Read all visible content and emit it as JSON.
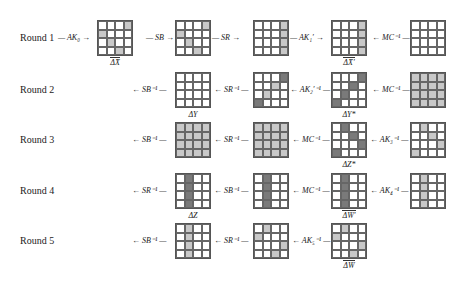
{
  "rounds": [
    {
      "label": "Round 1",
      "y": 20,
      "ops": [
        {
          "text": "— AK₀ →",
          "x": 58
        },
        {
          "text": "— SB →",
          "x": 146
        },
        {
          "text": "— SR →",
          "x": 212
        },
        {
          "text": "— AK₁′ →",
          "x": 290
        },
        {
          "text": "← MC⁻¹ —",
          "x": 372
        }
      ],
      "grids": [
        {
          "x": 97,
          "cells": "...l|l...|.l..|..l.",
          "caption": "ΔX̄",
          "overline": true
        },
        {
          "x": 175,
          "cells": "...l|l...|.l..|..l.",
          "caption": ""
        },
        {
          "x": 253,
          "cells": "...l|...l|...l|...l",
          "caption": ""
        },
        {
          "x": 331,
          "cells": "...l|...l|...l|...l",
          "caption": "ΔX̄′",
          "overline": true
        },
        {
          "x": 410,
          "cells": "....|....|....|....",
          "caption": ""
        }
      ]
    },
    {
      "label": "Round 2",
      "y": 72,
      "ops": [
        {
          "text": "← SB⁻¹ —",
          "x": 132
        },
        {
          "text": "← SR⁻¹ —",
          "x": 214
        },
        {
          "text": "← AK₂′⁻¹ —",
          "x": 290
        },
        {
          "text": "← MC⁻¹ —",
          "x": 372
        }
      ],
      "grids": [
        {
          "x": 175,
          "cells": "....|....|....|....",
          "caption": "ΔY"
        },
        {
          "x": 253,
          "cells": "...d|..l.|.l..|d...",
          "caption": ""
        },
        {
          "x": 331,
          "cells": "...d|..d.|.d..|d...",
          "caption": "ΔY*"
        },
        {
          "x": 410,
          "cells": "llll|llll|llll|llll",
          "caption": ""
        }
      ]
    },
    {
      "label": "Round 3",
      "y": 122,
      "ops": [
        {
          "text": "← SB⁻¹ —",
          "x": 132
        },
        {
          "text": "← SR⁻¹ —",
          "x": 214
        },
        {
          "text": "← MC⁻¹ —",
          "x": 292
        },
        {
          "text": "← AK₃⁻¹ —",
          "x": 370
        }
      ],
      "grids": [
        {
          "x": 175,
          "cells": "llll|llll|llll|llll",
          "caption": ""
        },
        {
          "x": 253,
          "cells": "llll|llll|llll|llll",
          "caption": ""
        },
        {
          "x": 331,
          "cells": ".d..|..d.|...d|d...",
          "caption": "ΔZ*"
        },
        {
          "x": 410,
          "cells": ".l..|..l.|...l|l...",
          "caption": ""
        }
      ]
    },
    {
      "label": "Round 4",
      "y": 173,
      "ops": [
        {
          "text": "← SR⁻¹ —",
          "x": 132
        },
        {
          "text": "← SB⁻¹ —",
          "x": 214
        },
        {
          "text": "← MC⁻¹ —",
          "x": 292
        },
        {
          "text": "← AK₄⁻¹ —",
          "x": 370
        }
      ],
      "grids": [
        {
          "x": 175,
          "cells": ".d..|.d..|.d..|.d..",
          "caption": "ΔZ"
        },
        {
          "x": 253,
          "cells": ".d..|.d..|.d..|.d..",
          "caption": ""
        },
        {
          "x": 331,
          "cells": ".d..|.d..|.d..|.d..",
          "caption": "ΔW̄′",
          "overline": true
        },
        {
          "x": 410,
          "cells": ".l..|.l..|.l..|.l..",
          "caption": ""
        }
      ]
    },
    {
      "label": "Round 5",
      "y": 223,
      "ops": [
        {
          "text": "← SB⁻¹ —",
          "x": 132
        },
        {
          "text": "← SR⁻¹ —",
          "x": 214
        },
        {
          "text": "← AK₅⁻¹ —",
          "x": 292
        }
      ],
      "grids": [
        {
          "x": 175,
          "cells": ".l..|.l..|.l..|.l..",
          "caption": ""
        },
        {
          "x": 253,
          "cells": ".l..|l...|...l|..l.",
          "caption": ""
        },
        {
          "x": 331,
          "cells": ".l..|l...|...l|..l.",
          "caption": "ΔW̄",
          "overline": true
        }
      ]
    }
  ],
  "colors": {
    "light": "#c8c8c8",
    "dark": "#7a7a7a"
  }
}
